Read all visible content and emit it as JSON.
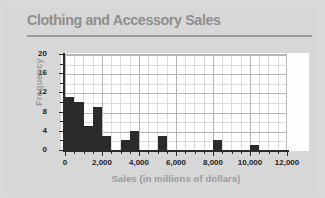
{
  "chart_data": {
    "type": "bar",
    "title": "Clothing and Accessory Sales",
    "xlabel": "Sales (in millions of dollars)",
    "ylabel": "Frequency",
    "xlim": [
      0,
      12000
    ],
    "ylim": [
      0,
      20
    ],
    "xticks": [
      0,
      2000,
      4000,
      6000,
      8000,
      10000,
      12000
    ],
    "xtick_labels": [
      "0",
      "2,000",
      "4,000",
      "6,000",
      "8,000",
      "10,000",
      "12,000"
    ],
    "yticks": [
      0,
      4,
      8,
      12,
      16,
      20
    ],
    "ytick_labels": [
      "0",
      "4",
      "8",
      "12",
      "16",
      "20"
    ],
    "grid": true,
    "bin_width": 500,
    "bars": [
      {
        "x_start": 0,
        "x_end": 500,
        "value": 11
      },
      {
        "x_start": 500,
        "x_end": 1000,
        "value": 10
      },
      {
        "x_start": 1000,
        "x_end": 1500,
        "value": 5
      },
      {
        "x_start": 1500,
        "x_end": 2000,
        "value": 9
      },
      {
        "x_start": 2000,
        "x_end": 2500,
        "value": 3
      },
      {
        "x_start": 3000,
        "x_end": 3500,
        "value": 2
      },
      {
        "x_start": 3500,
        "x_end": 4000,
        "value": 4
      },
      {
        "x_start": 5000,
        "x_end": 5500,
        "value": 3
      },
      {
        "x_start": 8000,
        "x_end": 8500,
        "value": 2
      },
      {
        "x_start": 10000,
        "x_end": 10500,
        "value": 1
      }
    ],
    "bar_color": "#2a2a2a",
    "background_color": "#d7d7d7",
    "plot_background_color": "#ffffff"
  }
}
